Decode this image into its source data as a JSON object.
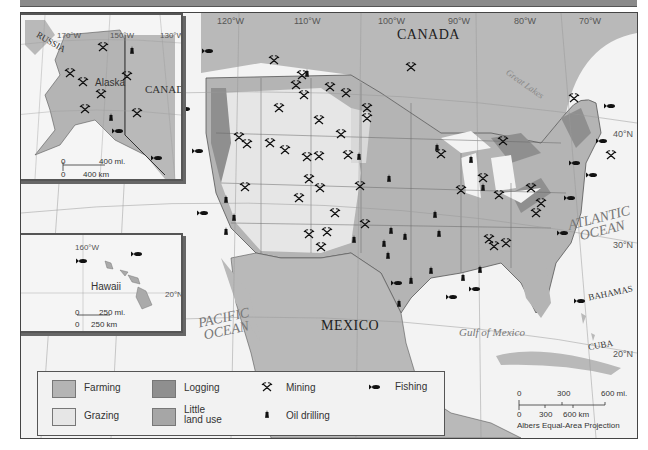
{
  "header": {
    "title": ""
  },
  "map": {
    "graticule": {
      "longitudes": [
        "140°W",
        "130°W",
        "120°W",
        "110°W",
        "100°W",
        "90°W",
        "80°W",
        "70°W"
      ],
      "latitudes": [
        "40°N",
        "30°N",
        "20°N"
      ]
    },
    "labels": {
      "canada": "CANADA",
      "mexico": "MEXICO",
      "pacific_ocean_line1": "PACIFIC",
      "pacific_ocean_line2": "OCEAN",
      "atlantic_ocean_line1": "ATLANTIC",
      "atlantic_ocean_line2": "OCEAN",
      "gulf_of_mexico": "Gulf of Mexico",
      "great_lakes": "Great Lakes",
      "bahamas": "BAHAMAS",
      "cuba": "CUBA"
    },
    "colors": {
      "farming": "#b4b4b4",
      "grazing": "#e6e6e6",
      "logging": "#8f8f8f",
      "little_land_use": "#a6a6a6",
      "water": "#f3f3f3",
      "foreign_land": "#b9b9b9"
    }
  },
  "alaska_inset": {
    "title": "Alaska",
    "russia": "RUSSIA",
    "canada": "CANADA",
    "graticule": [
      "170°W",
      "150°W",
      "130°W",
      "70°N",
      "60°N"
    ],
    "scale": {
      "mi_zero": "0",
      "mi": "400 mi.",
      "km_zero": "0",
      "km": "400 km"
    }
  },
  "hawaii_inset": {
    "title": "Hawaii",
    "graticule": [
      "160°W",
      "20°N"
    ],
    "scale": {
      "mi_zero": "0",
      "mi": "250 mi.",
      "km_zero": "0",
      "km": "250 km"
    }
  },
  "legend": {
    "items": [
      {
        "label": "Farming",
        "type": "swatch"
      },
      {
        "label": "Grazing",
        "type": "swatch"
      },
      {
        "label": "Logging",
        "type": "swatch"
      },
      {
        "label": "Little land use",
        "line1": "Little",
        "line2": "land use",
        "type": "swatch"
      },
      {
        "label": "Mining",
        "type": "symbol",
        "symbol": "⚒"
      },
      {
        "label": "Oil drilling",
        "type": "symbol",
        "symbol": "♜"
      },
      {
        "label": "Fishing",
        "type": "symbol",
        "symbol": "fish"
      }
    ]
  },
  "main_scale": {
    "mi_zero": "0",
    "mi_mid": "300",
    "mi_end": "600 mi.",
    "km_zero": "0",
    "km_mid": "300",
    "km_end": "600 km",
    "projection": "Albers Equal-Area Projection"
  }
}
